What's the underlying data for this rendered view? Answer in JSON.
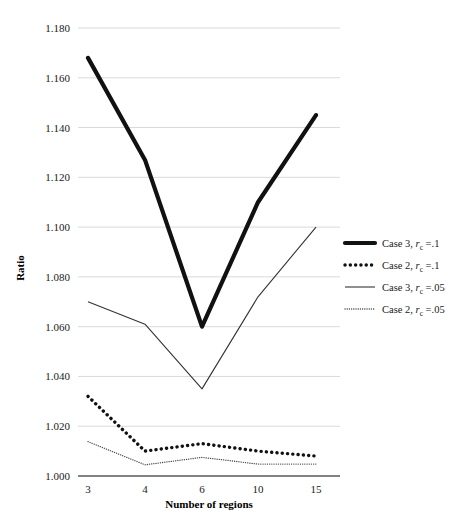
{
  "chart_data": {
    "type": "line",
    "title": "",
    "xlabel": "Number of regions",
    "ylabel": "Ratio",
    "categories": [
      "3",
      "4",
      "6",
      "10",
      "15"
    ],
    "x": [
      3,
      4,
      6,
      10,
      15
    ],
    "ylim": [
      1.0,
      1.18
    ],
    "yticks": [
      "1.000",
      "1.020",
      "1.040",
      "1.060",
      "1.080",
      "1.100",
      "1.120",
      "1.140",
      "1.160",
      "1.180"
    ],
    "ytick_values": [
      1.0,
      1.02,
      1.04,
      1.06,
      1.08,
      1.1,
      1.12,
      1.14,
      1.16,
      1.18
    ],
    "grid": true,
    "legend_position": "right",
    "series": [
      {
        "name": "Case 3, r_c =.1",
        "label_main": "Case 3, ",
        "label_var": "r",
        "label_sub": "c",
        "label_tail": " =.1",
        "style": "thick-solid",
        "color": "#111111",
        "values": [
          1.168,
          1.127,
          1.06,
          1.11,
          1.145
        ]
      },
      {
        "name": "Case 2, r_c =.1",
        "label_main": "Case 2, ",
        "label_var": "r",
        "label_sub": "c",
        "label_tail": " =.1",
        "style": "thick-dotted",
        "color": "#111111",
        "values": [
          1.032,
          1.01,
          1.013,
          1.01,
          1.008
        ]
      },
      {
        "name": "Case 3, r_c =.05",
        "label_main": "Case 3, ",
        "label_var": "r",
        "label_sub": "c",
        "label_tail": " =.05",
        "style": "thin-solid",
        "color": "#333333",
        "values": [
          1.07,
          1.061,
          1.035,
          1.072,
          1.1
        ]
      },
      {
        "name": "Case 2, r_c =.05",
        "label_main": "Case 2, ",
        "label_var": "r",
        "label_sub": "c",
        "label_tail": " =.05",
        "style": "thin-dotted",
        "color": "#444444",
        "values": [
          1.0138,
          1.0045,
          1.0075,
          1.0048,
          1.0048
        ]
      }
    ]
  }
}
